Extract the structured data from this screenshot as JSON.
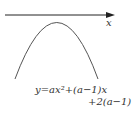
{
  "diagram": {
    "axis": {
      "label": "x",
      "color": "#222222"
    },
    "curve": {
      "type": "downward parabola",
      "color": "#555555"
    },
    "equation": {
      "line1": "y=ax²+(a−1)x",
      "line2": "+2(a−1)"
    }
  }
}
